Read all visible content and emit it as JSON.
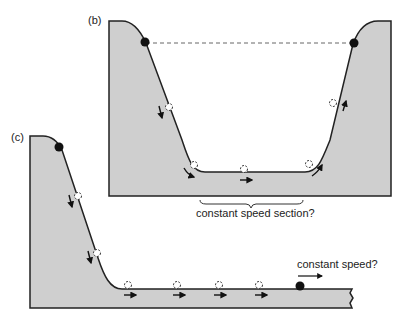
{
  "panels": {
    "b": {
      "label": "(b)",
      "caption": "constant speed section?"
    },
    "c": {
      "label": "(c)",
      "caption": "constant speed?"
    }
  },
  "colors": {
    "ground_fill": "#cfcfcf",
    "outline": "#222222",
    "ball": "#111111",
    "dashed_line": "#666666"
  }
}
